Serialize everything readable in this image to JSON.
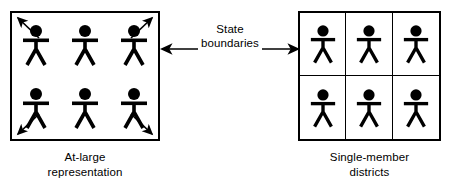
{
  "diagram": {
    "left_panel": {
      "caption_line1": "At-large",
      "caption_line2": "representation",
      "person_count": 6,
      "grid_columns": 3,
      "grid_rows": 2,
      "outward_arrow_count": 4,
      "arrow_directions": [
        "up-left",
        "up-right",
        "down-left",
        "down-right"
      ]
    },
    "center": {
      "label_line1": "State",
      "label_line2": "boundaries",
      "arrow_left_direction": "left",
      "arrow_right_direction": "right"
    },
    "right_panel": {
      "caption_line1": "Single-member",
      "caption_line2": "districts",
      "person_count": 6,
      "grid_columns": 3,
      "grid_rows": 2,
      "cells": [
        {
          "id": "district-1",
          "persons": 1
        },
        {
          "id": "district-2",
          "persons": 1
        },
        {
          "id": "district-3",
          "persons": 1
        },
        {
          "id": "district-4",
          "persons": 1
        },
        {
          "id": "district-5",
          "persons": 1
        },
        {
          "id": "district-6",
          "persons": 1
        }
      ]
    },
    "colors": {
      "stroke": "#000000",
      "fill": "#ffffff",
      "figure": "#000000"
    }
  }
}
